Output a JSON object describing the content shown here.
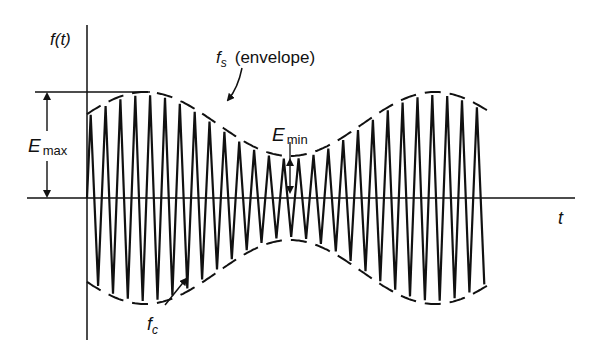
{
  "figure": {
    "type": "amplitude-modulated-wave-diagram",
    "stroke_color": "#111111",
    "background": "#ffffff"
  },
  "axes": {
    "y_label": "f(t)",
    "x_label": "t",
    "origin": {
      "x": 87,
      "y": 198
    },
    "y_axis": {
      "x": 87,
      "y_top": 25,
      "y_bottom": 340
    },
    "x_axis": {
      "y": 198,
      "x_left": 27,
      "x_right": 575
    }
  },
  "labels": {
    "envelope_symbol": "f",
    "envelope_sub": "s",
    "envelope_text": "(envelope)",
    "carrier_symbol": "f",
    "carrier_sub": "c",
    "emax_symbol": "E",
    "emax_sub": "max",
    "emin_symbol": "E",
    "emin_sub": "min"
  },
  "envelope": {
    "x_start": 87,
    "x_end": 492,
    "center_y": 198,
    "mean_amp": 74,
    "mod_amp": 32,
    "min_x": 290,
    "period_px": 290,
    "dash": "16 9"
  },
  "carrier": {
    "x_start": 87,
    "x_end": 488,
    "cycles": 27,
    "stroke_width": 2.2
  },
  "emax_marker": {
    "x": 47,
    "y_top": 92,
    "y_bottom": 198,
    "ref_line_x1": 35,
    "ref_line_x2": 150
  },
  "emin_marker": {
    "x": 290,
    "y_top": 158,
    "y_bottom": 198
  }
}
